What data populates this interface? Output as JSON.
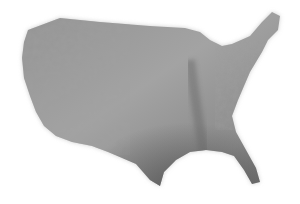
{
  "map": {
    "subject": "Shaded relief map of the contiguous United States",
    "style": "grayscale hillshade",
    "colors": {
      "background": "#ffffff",
      "land_light": "#a8a8a8",
      "land_mid": "#8c8c8c",
      "land_dark": "#5e5e5e",
      "mountains": "#7a7a7a"
    }
  }
}
